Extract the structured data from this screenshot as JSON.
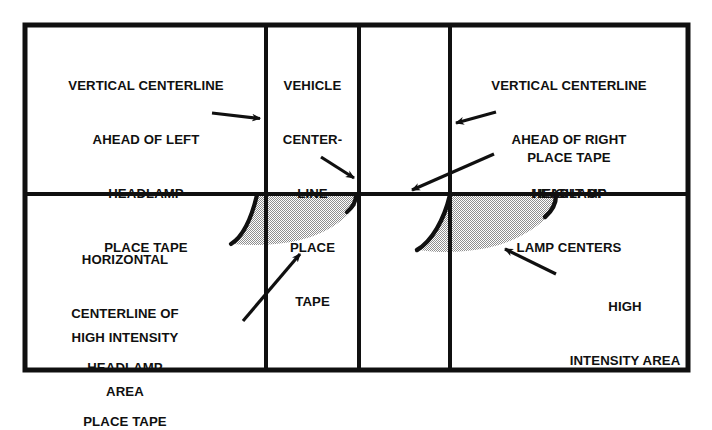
{
  "figure": {
    "kind": "headlamp-aim-screen-diagram",
    "background_color": "#ffffff",
    "line_color": "#101010",
    "beam_fill_color": "#b8b8b8",
    "beam_outline_color": "#101010"
  },
  "labels": {
    "left_vertical_centerline": {
      "name": "vertical-centerline-ahead-of-left-headlamp",
      "lines": [
        "VERTICAL CENTERLINE",
        "AHEAD OF LEFT",
        "HEADLAMP",
        "PLACE TAPE"
      ]
    },
    "vehicle_centerline": {
      "name": "vehicle-centerline-place-tape",
      "lines": [
        "VEHICLE",
        "CENTER-",
        "LINE",
        "PLACE",
        "TAPE"
      ]
    },
    "right_vertical_centerline": {
      "name": "vertical-centerline-ahead-of-right-headlamp",
      "lines": [
        "VERTICAL CENTERLINE",
        "AHEAD OF RIGHT",
        "HEADLAMP"
      ]
    },
    "place_tape_right": {
      "name": "place-tape-right",
      "lines": [
        "PLACE TAPE"
      ]
    },
    "height_of_lamp_centers": {
      "name": "height-of-lamp-centers",
      "lines": [
        "HEIGHT OF",
        "LAMP CENTERS"
      ]
    },
    "horizontal_centerline": {
      "name": "horizontal-centerline-of-headlamp",
      "lines": [
        "HORIZONTAL",
        "CENTERLINE OF",
        "HEADLAMP",
        "PLACE TAPE"
      ]
    },
    "high_intensity_left": {
      "name": "high-intensity-area-left",
      "lines": [
        "HIGH INTENSITY",
        "AREA"
      ]
    },
    "high_intensity_right": {
      "name": "high-intensity-area-right",
      "lines": [
        "HIGH",
        "INTENSITY AREA"
      ]
    }
  },
  "geometry": {
    "outer_border": {
      "x": 25,
      "y": 25,
      "width": 663,
      "height": 345
    },
    "vertical_lines_x": [
      266,
      359,
      450
    ],
    "horizontal_line_y": 194,
    "beams": [
      {
        "name": "left-headlamp-beam",
        "x_start": 230,
        "x_end": 356
      },
      {
        "name": "right-headlamp-beam",
        "x_start": 418,
        "x_end": 558
      }
    ],
    "arrows": [
      {
        "name": "arrow-to-left-vertical-centerline",
        "from": [
          212,
          113
        ],
        "to": [
          265,
          119
        ]
      },
      {
        "name": "arrow-to-vehicle-centerline",
        "from": [
          321,
          157
        ],
        "to": [
          358,
          181
        ]
      },
      {
        "name": "arrow-to-right-vertical-centerline",
        "from": [
          496,
          112
        ],
        "to": [
          452,
          124
        ]
      },
      {
        "name": "arrow-to-height-of-lamp-centers",
        "from": [
          494,
          154
        ],
        "to": [
          407,
          192
        ]
      },
      {
        "name": "arrow-to-high-intensity-left",
        "from": [
          243,
          321
        ],
        "to": [
          304,
          250
        ]
      },
      {
        "name": "arrow-to-high-intensity-right",
        "from": [
          556,
          274
        ],
        "to": [
          501,
          247
        ]
      }
    ]
  }
}
